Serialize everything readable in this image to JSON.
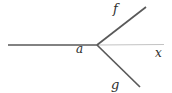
{
  "figure": {
    "background": "#ffffff",
    "line_color": "#595959",
    "axis_faint_color": "#c3c3c3",
    "text_color": "#2e2e2e",
    "vertex": {
      "x": 97,
      "y": 45
    },
    "lines": [
      {
        "name": "axis-left-segment",
        "x1": 8,
        "y1": 45,
        "x2": 97,
        "y2": 45,
        "color": "#595959",
        "width": 1.7
      },
      {
        "name": "axis-right-segment",
        "x1": 97,
        "y1": 45,
        "x2": 164,
        "y2": 44.5,
        "color": "#c3c3c3",
        "width": 1
      },
      {
        "name": "ray-f",
        "x1": 97,
        "y1": 45,
        "x2": 146,
        "y2": 7,
        "color": "#595959",
        "width": 1.7
      },
      {
        "name": "ray-g",
        "x1": 97,
        "y1": 45,
        "x2": 140,
        "y2": 87,
        "color": "#595959",
        "width": 1.7
      }
    ],
    "labels": {
      "a": {
        "text": "a",
        "x": 76,
        "y": 53
      },
      "f": {
        "text": "f",
        "x": 113,
        "y": 13
      },
      "g": {
        "text": "g",
        "x": 111,
        "y": 89
      },
      "x": {
        "text": "x",
        "x": 155,
        "y": 57
      }
    }
  }
}
